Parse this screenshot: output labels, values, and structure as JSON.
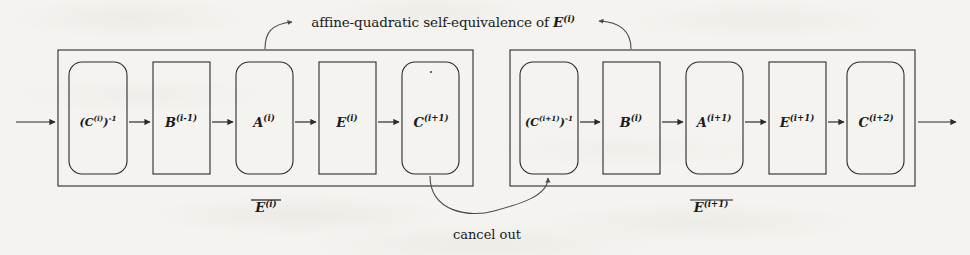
{
  "figure": {
    "title_caption": {
      "text_before": "affine-quadratic self-equivalence of ",
      "symbol": "E",
      "symbol_sup": "(i)",
      "full_text": "affine-quadratic self-equivalence of E^(i)"
    },
    "cancel_label": "cancel out",
    "colors": {
      "ink": "#1a1a1a",
      "paper": "#f4f3ef",
      "arrow": "#2a2a2a",
      "curve": "#555555"
    },
    "groups": [
      {
        "name": "group-left",
        "outer_label_base": "E",
        "outer_label_sup": "(i)",
        "outer_label_overline": true,
        "boxes": [
          {
            "id": "box-c-inv-i",
            "base": "(C",
            "sup_inner": "(i)",
            "mid": ")",
            "sup_outer": "-1",
            "shape": "rounded",
            "size": "small"
          },
          {
            "id": "box-b-i-1",
            "base": "B",
            "sup": "(i-1)",
            "shape": "sharp",
            "size": "normal"
          },
          {
            "id": "box-a-i",
            "base": "A",
            "sup": "(i)",
            "shape": "rounded",
            "size": "normal"
          },
          {
            "id": "box-e-i",
            "base": "E",
            "sup": "(i)",
            "shape": "sharp",
            "size": "normal"
          },
          {
            "id": "box-c-i-1",
            "base": "C",
            "sup": "(i+1)",
            "shape": "rounded",
            "size": "normal"
          }
        ]
      },
      {
        "name": "group-right",
        "outer_label_base": "E",
        "outer_label_sup": "(i+1)",
        "outer_label_overline": true,
        "boxes": [
          {
            "id": "box-c-inv-i-1",
            "base": "(C",
            "sup_inner": "(i+1)",
            "mid": ")",
            "sup_outer": "-1",
            "shape": "rounded",
            "size": "small"
          },
          {
            "id": "box-b-i",
            "base": "B",
            "sup": "(i)",
            "shape": "sharp",
            "size": "normal"
          },
          {
            "id": "box-a-i-1",
            "base": "A",
            "sup": "(i+1)",
            "shape": "rounded",
            "size": "normal"
          },
          {
            "id": "box-e-i-1",
            "base": "E",
            "sup": "(i+1)",
            "shape": "sharp",
            "size": "normal"
          },
          {
            "id": "box-c-i-2",
            "base": "C",
            "sup": "(i+2)",
            "shape": "rounded",
            "size": "normal"
          }
        ]
      }
    ],
    "annotations": {
      "top_arrow_from_left": "A^(i) box",
      "top_arrow_from_right": "B^(i) box",
      "bottom_arrow_from": "C^(i+1) box",
      "bottom_arrow_to": "(C^(i+1))^-1 box"
    }
  }
}
